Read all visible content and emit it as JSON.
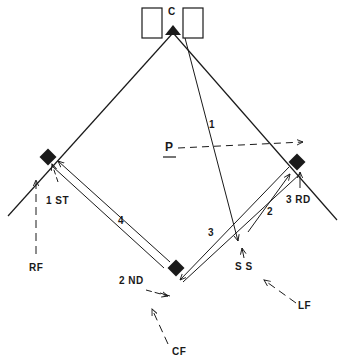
{
  "diagram": {
    "type": "baseball-field-play-diagram",
    "colors": {
      "ink": "#1a1a1a",
      "background": "#ffffff"
    },
    "labels": {
      "catcher": "C",
      "pitcher": "P",
      "first_base": "1 ST",
      "second_base": "2 ND",
      "third_base": "3 RD",
      "shortstop": "S S",
      "right_field": "RF",
      "center_field": "CF",
      "left_field": "LF"
    },
    "play_numbers": {
      "throw_1": "1",
      "throw_2": "2",
      "throw_3": "3",
      "throw_4": "4"
    },
    "bases": [
      "home",
      "first",
      "second",
      "third"
    ],
    "paths": [
      {
        "id": "1",
        "from": "catcher",
        "to": "shortstop-area",
        "style": "solid-arrow"
      },
      {
        "id": "2",
        "from": "shortstop-area",
        "to": "third",
        "style": "solid-arrow"
      },
      {
        "id": "3",
        "from": "third",
        "to": "second",
        "style": "solid-arrow-double"
      },
      {
        "id": "4",
        "from": "second",
        "to": "first",
        "style": "solid-arrow-double"
      },
      {
        "id": "P",
        "from": "pitcher",
        "to": "third",
        "style": "dashed-arrow"
      },
      {
        "id": "RF",
        "from": "right-field",
        "to": "first",
        "style": "dashed-arrow"
      },
      {
        "id": "CF",
        "from": "center-field",
        "to": "second",
        "style": "dashed-arrow"
      },
      {
        "id": "LF",
        "from": "left-field",
        "to": "shortstop-area",
        "style": "dashed-arrow"
      }
    ]
  }
}
